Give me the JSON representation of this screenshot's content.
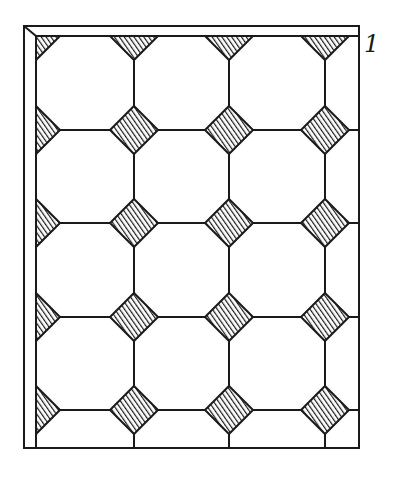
{
  "figure": {
    "number_label": "1",
    "ink_color": "#1a1a1a",
    "background": "#ffffff",
    "frame": {
      "outer": [
        24,
        26,
        359,
        448
      ],
      "inner_left": 36,
      "inner_top": 36
    },
    "grid": {
      "columns_x": [
        36,
        134,
        229,
        325,
        359
      ],
      "rows_y": [
        36,
        130,
        223,
        317,
        410,
        448
      ]
    },
    "diamond_half_size": 24
  }
}
